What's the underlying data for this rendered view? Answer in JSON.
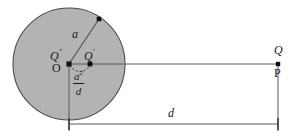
{
  "figure": {
    "colors": {
      "disk_fill": "#b3b3b3",
      "disk_stroke": "#4d4d4d",
      "line": "#595959",
      "text": "#1a1a1a",
      "background": "#ffffff"
    },
    "circle": {
      "center_label": "O",
      "radius_label": "a",
      "cx": 69,
      "cy": 64,
      "r": 56
    },
    "points": [
      {
        "name": "point-O",
        "label": "O",
        "style": "upright",
        "x": 69,
        "y": 64
      },
      {
        "name": "point-Q-double-prime",
        "label": "Q",
        "prime": "″",
        "style": "italic",
        "x": 69,
        "y": 64
      },
      {
        "name": "point-Q-prime",
        "label": "Q",
        "prime": "′",
        "style": "italic",
        "x": 90,
        "y": 64
      },
      {
        "name": "point-Q",
        "label": "Q",
        "style": "italic",
        "x": 278,
        "y": 64
      },
      {
        "name": "point-P",
        "label": "P",
        "style": "upright",
        "x": 278,
        "y": 64
      },
      {
        "name": "point-circle-radius-end",
        "label": "",
        "style": "none",
        "x": 99,
        "y": 19
      }
    ],
    "labels": {
      "radius": "a",
      "distance": "d",
      "inverse_numerator": "a",
      "inverse_numerator_exponent": "2",
      "inverse_denominator": "d",
      "origin": "O",
      "q_double_prime_base": "Q",
      "q_double_prime_mark": "″",
      "q_prime_base": "Q",
      "q_prime_mark": "′",
      "q_base": "Q",
      "p_base": "P"
    },
    "dimension": {
      "name": "distance-d",
      "label": "d",
      "from_x": 69,
      "to_x": 278,
      "y": 124
    }
  }
}
